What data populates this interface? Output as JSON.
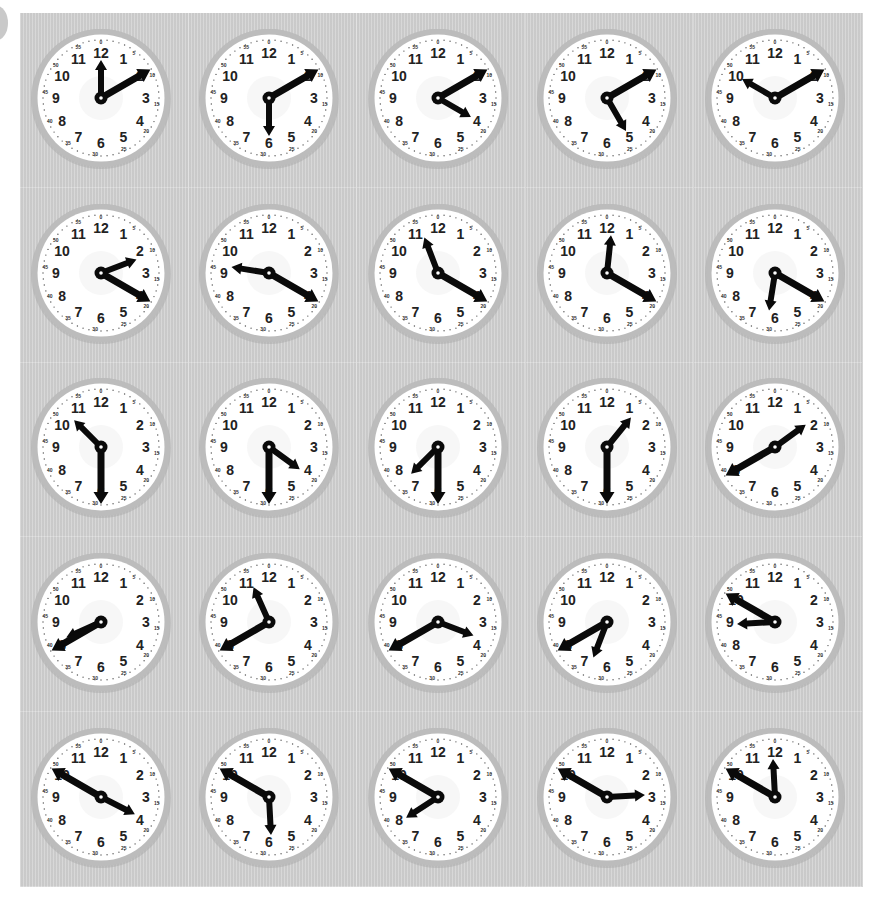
{
  "worksheet": {
    "rows": 5,
    "columns": 5,
    "background_color": "#d0d0d0",
    "clock_style": {
      "bezel_color": "#bcbcbc",
      "face_color": "#ffffff",
      "hand_color": "#0a0a0a",
      "numeral_color": "#222222",
      "hour_numerals": [
        "12",
        "1",
        "2",
        "3",
        "4",
        "5",
        "6",
        "7",
        "8",
        "9",
        "10",
        "11"
      ],
      "minute_labels": [
        "0",
        "5",
        "10",
        "15",
        "20",
        "25",
        "30",
        "35",
        "40",
        "45",
        "50",
        "55"
      ]
    },
    "clocks": [
      {
        "index": 1,
        "row": 1,
        "col": 1,
        "hour_hand": 12,
        "minute_hand": 10,
        "time": "12:10"
      },
      {
        "index": 2,
        "row": 1,
        "col": 2,
        "hour_hand": 6,
        "minute_hand": 10,
        "time": "6:10"
      },
      {
        "index": 3,
        "row": 1,
        "col": 3,
        "hour_hand": 4,
        "minute_hand": 10,
        "time": "4:10"
      },
      {
        "index": 4,
        "row": 1,
        "col": 4,
        "hour_hand": 5,
        "minute_hand": 10,
        "time": "5:10"
      },
      {
        "index": 5,
        "row": 1,
        "col": 5,
        "hour_hand": 10,
        "minute_hand": 10,
        "time": "10:10"
      },
      {
        "index": 6,
        "row": 2,
        "col": 1,
        "hour_hand": 2.3,
        "minute_hand": 20,
        "time": "2:20"
      },
      {
        "index": 7,
        "row": 2,
        "col": 2,
        "hour_hand": 9.3,
        "minute_hand": 20,
        "time": "9:20"
      },
      {
        "index": 8,
        "row": 2,
        "col": 3,
        "hour_hand": 11.3,
        "minute_hand": 20,
        "time": "11:20"
      },
      {
        "index": 9,
        "row": 2,
        "col": 4,
        "hour_hand": 12.2,
        "minute_hand": 20,
        "time": "12:20"
      },
      {
        "index": 10,
        "row": 2,
        "col": 5,
        "hour_hand": 6.3,
        "minute_hand": 20,
        "time": "6:20"
      },
      {
        "index": 11,
        "row": 3,
        "col": 1,
        "hour_hand": 10.5,
        "minute_hand": 30,
        "time": "10:30"
      },
      {
        "index": 12,
        "row": 3,
        "col": 2,
        "hour_hand": 4.2,
        "minute_hand": 30,
        "time": "4:30"
      },
      {
        "index": 13,
        "row": 3,
        "col": 3,
        "hour_hand": 7.5,
        "minute_hand": 30,
        "time": "7:30"
      },
      {
        "index": 14,
        "row": 3,
        "col": 4,
        "hour_hand": 1.3,
        "minute_hand": 30,
        "time": "1:30"
      },
      {
        "index": 15,
        "row": 3,
        "col": 5,
        "hour_hand": 1.8,
        "minute_hand": 40,
        "time": "1:40"
      },
      {
        "index": 16,
        "row": 4,
        "col": 1,
        "hour_hand": 8.2,
        "minute_hand": 40,
        "time": "8:40"
      },
      {
        "index": 17,
        "row": 4,
        "col": 2,
        "hour_hand": 11.2,
        "minute_hand": 40,
        "time": "11:40"
      },
      {
        "index": 18,
        "row": 4,
        "col": 3,
        "hour_hand": 3.7,
        "minute_hand": 40,
        "time": "3:40"
      },
      {
        "index": 19,
        "row": 4,
        "col": 4,
        "hour_hand": 6.7,
        "minute_hand": 40,
        "time": "6:40"
      },
      {
        "index": 20,
        "row": 4,
        "col": 5,
        "hour_hand": 8.9,
        "minute_hand": 50,
        "time": "8:50"
      },
      {
        "index": 21,
        "row": 5,
        "col": 1,
        "hour_hand": 3.9,
        "minute_hand": 50,
        "time": "3:50"
      },
      {
        "index": 22,
        "row": 5,
        "col": 2,
        "hour_hand": 5.9,
        "minute_hand": 50,
        "time": "5:50"
      },
      {
        "index": 23,
        "row": 5,
        "col": 3,
        "hour_hand": 7.9,
        "minute_hand": 50,
        "time": "7:50"
      },
      {
        "index": 24,
        "row": 5,
        "col": 4,
        "hour_hand": 2.9,
        "minute_hand": 50,
        "time": "2:50"
      },
      {
        "index": 25,
        "row": 5,
        "col": 5,
        "hour_hand": 11.9,
        "minute_hand": 50,
        "time": "11:50"
      }
    ]
  }
}
